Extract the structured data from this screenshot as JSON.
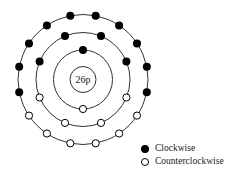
{
  "diagram": {
    "nucleus_label": "26p",
    "center": [
      83,
      79.5
    ],
    "nucleus_radius": 13,
    "colors": {
      "line": "#333333",
      "filled": "#000000",
      "open": "#ffffff"
    },
    "shells": [
      {
        "name": "inner",
        "radius": 29.5,
        "electron_count": 2,
        "clockwise": 1,
        "counterclockwise": 1
      },
      {
        "name": "middle",
        "radius": 47,
        "electron_count": 8,
        "clockwise": 4,
        "counterclockwise": 4
      },
      {
        "name": "outer",
        "radius": 65,
        "electron_count": 16,
        "clockwise": 10,
        "counterclockwise": 6
      }
    ]
  },
  "legend": {
    "items": [
      {
        "symbol": "filled-circle",
        "label": "Clockwise"
      },
      {
        "symbol": "open-circle",
        "label": "Counterclockwise"
      }
    ]
  }
}
